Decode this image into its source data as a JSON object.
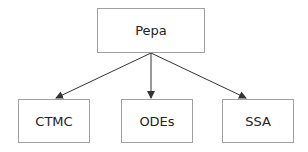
{
  "diagram": {
    "root": {
      "label": "Pepa"
    },
    "children": [
      {
        "label": "CTMC"
      },
      {
        "label": "ODEs"
      },
      {
        "label": "SSA"
      }
    ],
    "edges": [
      {
        "from": "Pepa",
        "to": "CTMC"
      },
      {
        "from": "Pepa",
        "to": "ODEs"
      },
      {
        "from": "Pepa",
        "to": "SSA"
      }
    ],
    "colors": {
      "border": "#a0a0a0",
      "arrow": "#333333",
      "text": "#222222"
    }
  }
}
